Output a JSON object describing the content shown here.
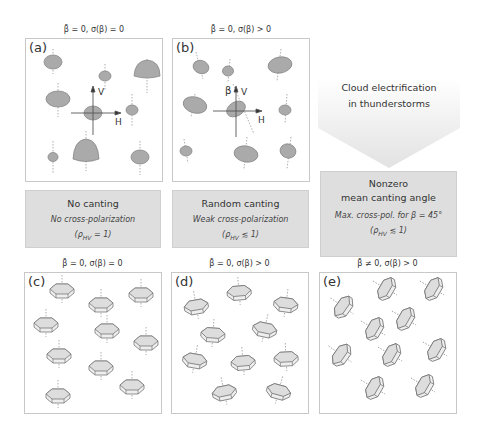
{
  "top_row": {
    "panels": [
      {
        "label": "(a)",
        "title": "β̄ = 0,  σ(β) = 0",
        "axis_v": "V",
        "axis_h": "H"
      },
      {
        "label": "(b)",
        "title": "β̄ = 0,  σ(β) > 0",
        "axis_v": "V",
        "axis_h": "H",
        "angle": "β"
      }
    ],
    "arrow_text_line1": "Cloud electrification",
    "arrow_text_line2": "in thunderstorms"
  },
  "info_boxes": [
    {
      "heading": "No canting",
      "subtext": "No cross-polarization",
      "rho": "(ρ",
      "rho_sub": "HV",
      "rho_rel": " = 1)"
    },
    {
      "heading": "Random canting",
      "subtext": "Weak cross-polarization",
      "rho": "(ρ",
      "rho_sub": "HV",
      "rho_rel": " ≲ 1)"
    },
    {
      "heading_line1": "Nonzero",
      "heading_line2": "mean canting angle",
      "subtext": "Max. cross-pol. for β = 45°",
      "rho": "(ρ",
      "rho_sub": "HV",
      "rho_rel": " ≲ 1)"
    }
  ],
  "bottom_row": {
    "panels": [
      {
        "label": "(c)",
        "title": "β̄ = 0,  σ(β) = 0"
      },
      {
        "label": "(d)",
        "title": "β̄ = 0,  σ(β) > 0"
      },
      {
        "label": "(e)",
        "title": "β̄ ≠ 0,  σ(β) > 0"
      }
    ]
  },
  "colors": {
    "drop_fill": "#a9a9a9",
    "box_fill": "#dedede",
    "arrow_fill": "#e6e6e6",
    "border": "#c8c8c8"
  }
}
